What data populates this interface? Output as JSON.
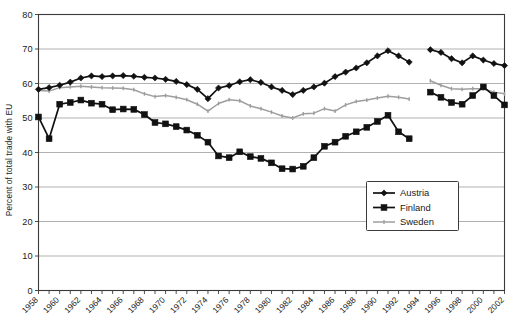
{
  "chart_data": {
    "type": "line",
    "title": "",
    "xlabel": "",
    "ylabel": "Percent of total trade with EU",
    "ylim": [
      0,
      80
    ],
    "ytick_step": 10,
    "yticks": [
      0,
      10,
      20,
      30,
      40,
      50,
      60,
      70,
      80
    ],
    "xlim": [
      1958,
      2002
    ],
    "xticks": [
      1958,
      1959,
      1960,
      1961,
      1962,
      1963,
      1964,
      1965,
      1966,
      1967,
      1968,
      1969,
      1970,
      1971,
      1972,
      1973,
      1974,
      1975,
      1976,
      1977,
      1978,
      1979,
      1980,
      1981,
      1982,
      1983,
      1984,
      1985,
      1986,
      1987,
      1988,
      1989,
      1990,
      1991,
      1992,
      1993,
      1994,
      1995,
      1996,
      1997,
      1998,
      1999,
      2000,
      2001,
      2002
    ],
    "xtick_labels": [
      "1958",
      "",
      "1960",
      "",
      "1962",
      "",
      "1964",
      "",
      "1966",
      "",
      "1968",
      "",
      "1970",
      "",
      "1972",
      "",
      "1974",
      "",
      "1976",
      "",
      "1978",
      "",
      "1980",
      "",
      "1982",
      "",
      "1984",
      "",
      "1986",
      "",
      "1988",
      "",
      "1990",
      "",
      "1992",
      "",
      "1994",
      "",
      "1996",
      "",
      "1998",
      "",
      "2000",
      "",
      "2002"
    ],
    "grid": "horizontal",
    "legend_position": "inside-right-middle",
    "series": [
      {
        "name": "Austria",
        "marker": "diamond",
        "color": "#111111",
        "x": [
          1958,
          1959,
          1960,
          1961,
          1962,
          1963,
          1964,
          1965,
          1966,
          1967,
          1968,
          1969,
          1970,
          1971,
          1972,
          1973,
          1974,
          1975,
          1976,
          1977,
          1978,
          1979,
          1980,
          1981,
          1982,
          1983,
          1984,
          1985,
          1986,
          1987,
          1988,
          1989,
          1990,
          1991,
          1992,
          1993
        ],
        "values": [
          58.3,
          58.8,
          59.5,
          60.4,
          61.6,
          62.2,
          62.0,
          62.2,
          62.3,
          62.1,
          61.8,
          61.6,
          61.2,
          60.6,
          59.7,
          58.3,
          55.6,
          58.7,
          59.4,
          60.5,
          61.1,
          60.3,
          59.0,
          58.0,
          56.8,
          58.0,
          59.0,
          60.1,
          62.0,
          63.3,
          64.5,
          66.0,
          68.0,
          69.5,
          68.0,
          66.2
        ],
        "x2": [
          1995,
          1996,
          1997,
          1998,
          1999,
          2000,
          2001,
          2002
        ],
        "values2": [
          69.8,
          69.0,
          67.2,
          66.0,
          68.0,
          66.8,
          65.8,
          65.2
        ]
      },
      {
        "name": "Finland",
        "marker": "square",
        "color": "#111111",
        "x": [
          1958,
          1959,
          1960,
          1961,
          1962,
          1963,
          1964,
          1965,
          1966,
          1967,
          1968,
          1969,
          1970,
          1971,
          1972,
          1973,
          1974,
          1975,
          1976,
          1977,
          1978,
          1979,
          1980,
          1981,
          1982,
          1983,
          1984,
          1985,
          1986,
          1987,
          1988,
          1989,
          1990,
          1991,
          1992,
          1993
        ],
        "values": [
          50.3,
          44.0,
          54.0,
          54.5,
          55.2,
          54.3,
          54.0,
          52.4,
          52.6,
          52.5,
          51.0,
          48.7,
          48.3,
          47.5,
          46.5,
          45.0,
          43.0,
          39.0,
          38.5,
          40.2,
          38.8,
          38.3,
          37.0,
          35.3,
          35.2,
          36.0,
          38.5,
          41.8,
          43.0,
          44.7,
          46.0,
          47.3,
          49.0,
          50.8,
          46.0,
          44.0
        ],
        "x2": [
          1995,
          1996,
          1997,
          1998,
          1999,
          2000,
          2001,
          2002
        ],
        "values2": [
          57.5,
          56.0,
          54.5,
          54.0,
          56.5,
          59.0,
          56.5,
          53.8
        ]
      },
      {
        "name": "Sweden",
        "marker": "tick",
        "color": "#9e9e9e",
        "x": [
          1958,
          1959,
          1960,
          1961,
          1962,
          1963,
          1964,
          1965,
          1966,
          1967,
          1968,
          1969,
          1970,
          1971,
          1972,
          1973,
          1974,
          1975,
          1976,
          1977,
          1978,
          1979,
          1980,
          1981,
          1982,
          1983,
          1984,
          1985,
          1986,
          1987,
          1988,
          1989,
          1990,
          1991,
          1992,
          1993
        ],
        "values": [
          58.0,
          57.8,
          58.8,
          59.0,
          59.2,
          59.0,
          58.8,
          58.7,
          58.6,
          58.2,
          57.0,
          56.2,
          56.5,
          56.0,
          55.3,
          54.0,
          52.0,
          54.2,
          55.3,
          55.0,
          53.5,
          52.7,
          51.7,
          50.6,
          50.0,
          51.2,
          51.4,
          52.7,
          52.0,
          53.8,
          54.8,
          55.2,
          55.8,
          56.3,
          56.0,
          55.5
        ],
        "x2": [
          1995,
          1996,
          1997,
          1998,
          1999,
          2000,
          2001,
          2002
        ],
        "values2": [
          60.8,
          59.5,
          58.5,
          58.3,
          58.5,
          58.5,
          57.5,
          57.0
        ]
      }
    ]
  },
  "legend": {
    "items": [
      {
        "label": "Austria"
      },
      {
        "label": "Finland"
      },
      {
        "label": "Sweden"
      }
    ]
  }
}
